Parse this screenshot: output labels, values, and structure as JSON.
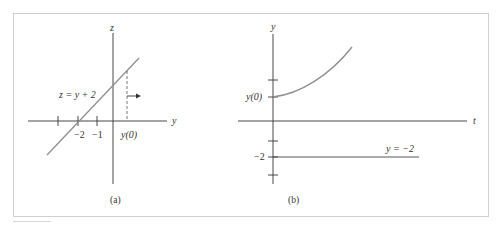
{
  "figure": {
    "panel_a": {
      "caption": "(a)",
      "vertical_axis_label": "z",
      "horizontal_axis_label": "y",
      "line_label": "z = y + 2",
      "tick_labels": {
        "minus_two": "−2",
        "minus_one": "−1",
        "initial": "y(0)"
      },
      "direction_arrow": "right"
    },
    "panel_b": {
      "caption": "(b)",
      "vertical_axis_label": "y",
      "horizontal_axis_label": "t",
      "tick_labels": {
        "initial": "y(0)",
        "minus_two": "−2"
      },
      "equilibrium_label": "y = −2"
    },
    "colors": {
      "axis": "#333333",
      "curve": "#9a9a9a",
      "frame": "#cfcfcf"
    }
  }
}
